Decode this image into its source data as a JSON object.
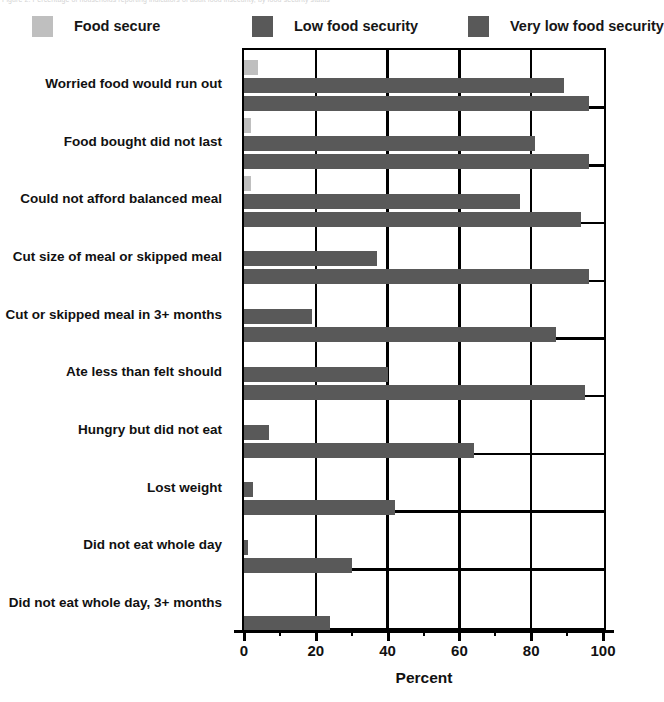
{
  "page": {
    "top_ghost_text": "Figure 2. Percentage of households reporting indicators of adult food insecurity, by food security status"
  },
  "legend": {
    "items": [
      {
        "label": "Food secure",
        "color": "#bfbfbf",
        "icon": "legend-swatch-icon"
      },
      {
        "label": "Low food security",
        "color": "#595959",
        "icon": "legend-swatch-icon"
      },
      {
        "label": "Very low food security",
        "color": "#595959",
        "icon": "legend-swatch-icon"
      }
    ]
  },
  "chart_data": {
    "type": "bar",
    "orientation": "horizontal",
    "title": "",
    "xlabel": "Percent",
    "ylabel": "",
    "xlim": [
      0,
      100
    ],
    "xticks": [
      0,
      20,
      40,
      60,
      80,
      100
    ],
    "xtick_labels": [
      "0",
      "20",
      "40",
      "60",
      "80",
      "100"
    ],
    "xminor_ticks": [
      10,
      30,
      50,
      70,
      90
    ],
    "grid": true,
    "legend_position": "top",
    "categories": [
      "Worried food would run out",
      "Food bought did not last",
      "Could not afford balanced meal",
      "Cut size of meal or skipped meal",
      "Cut or skipped meal in 3+ months",
      "Ate less than felt should",
      "Hungry but did not eat",
      "Lost weight",
      "Did not eat whole day",
      "Did not eat whole day, 3+ months"
    ],
    "series": [
      {
        "name": "Food secure",
        "color": "#bfbfbf",
        "values": [
          4,
          2,
          2,
          0,
          0,
          0,
          0,
          0,
          0,
          0
        ]
      },
      {
        "name": "Low food security",
        "color": "#595959",
        "values": [
          89,
          81,
          77,
          37,
          19,
          40,
          7,
          2.5,
          1,
          0
        ]
      },
      {
        "name": "Very low food security",
        "color": "#595959",
        "values": [
          96,
          96,
          94,
          96,
          87,
          95,
          64,
          42,
          30,
          24
        ]
      }
    ]
  },
  "axis": {
    "x_title": "Percent"
  }
}
